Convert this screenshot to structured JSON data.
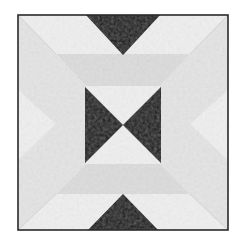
{
  "image": {
    "subject": "quilt block",
    "width": 240,
    "height": 241,
    "background": "#ffffff"
  },
  "colors": {
    "frame_border": "#2a2a2a",
    "fabric_light": "#efefef",
    "fabric_mid": "#e4e4e4",
    "fabric_band": "#dcdcdc",
    "fabric_dark": "#161616"
  },
  "block": {
    "outer": {
      "x": 18,
      "y": 15,
      "w": 210,
      "h": 215
    },
    "inner_square": {
      "x": 56,
      "y": 54,
      "w": 134,
      "h": 140
    }
  },
  "pieces": [
    {
      "name": "outer-field",
      "fill": "fabric_light",
      "points": "18,15 228,15 228,230 18,230"
    },
    {
      "name": "left-corner-triangle-top",
      "fill": "fabric_mid",
      "points": "18,15 56,54 56,124 18,90"
    },
    {
      "name": "left-corner-triangle-bottom",
      "fill": "fabric_mid",
      "points": "18,160 56,124 56,194 18,230"
    },
    {
      "name": "right-corner-triangle-top",
      "fill": "fabric_mid",
      "points": "228,15 190,54 190,124 228,90"
    },
    {
      "name": "right-corner-triangle-bottom",
      "fill": "fabric_mid",
      "points": "228,160 190,124 190,194 228,230"
    },
    {
      "name": "top-band",
      "fill": "fabric_band",
      "points": "56,54 190,54 160,86 86,86"
    },
    {
      "name": "bottom-band",
      "fill": "fabric_band",
      "points": "56,194 190,194 160,164 86,164"
    },
    {
      "name": "left-band",
      "fill": "fabric_mid",
      "points": "56,54 86,86 86,164 56,194"
    },
    {
      "name": "right-band",
      "fill": "fabric_mid",
      "points": "190,54 160,86 160,164 190,194"
    },
    {
      "name": "center-field",
      "fill": "fabric_light",
      "points": "86,86 160,86 160,164 86,164"
    },
    {
      "name": "top-dark-triangle",
      "fill": "fabric_dark",
      "points": "86,15 160,15 123,55"
    },
    {
      "name": "bowtie-left-triangle",
      "fill": "fabric_dark",
      "points": "85,87 123,125 85,163"
    },
    {
      "name": "bowtie-right-triangle",
      "fill": "fabric_dark",
      "points": "161,87 123,125 161,163"
    },
    {
      "name": "bottom-dark-triangle",
      "fill": "fabric_dark",
      "points": "88,230 158,230 123,194"
    }
  ],
  "seams": [
    {
      "name": "seam-diagonal-top-left",
      "points": "18,15 56,54"
    },
    {
      "name": "seam-diagonal-top-right",
      "points": "228,15 190,54"
    },
    {
      "name": "seam-diagonal-bottom-left",
      "points": "18,230 56,194"
    },
    {
      "name": "seam-diagonal-bottom-right",
      "points": "228,230 190,194"
    }
  ]
}
